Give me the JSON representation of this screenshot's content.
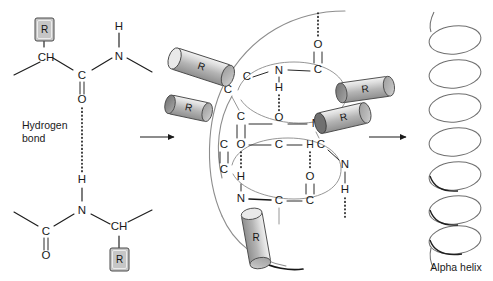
{
  "figure": {
    "background": "#ffffff",
    "accent_grey": "#c6c6c6",
    "line_color": "#1d1d1d"
  },
  "panel_left": {
    "name": "hydrogen-bond-detail",
    "hydrogen_bond_label": "Hydrogen\nbond",
    "hydrogen_bond_label_line1": "Hydrogen",
    "hydrogen_bond_label_line2": "bond",
    "top_chain": {
      "r_group": "R",
      "alpha_carbon": "CH",
      "carbonyl_carbon": "C",
      "carbonyl_oxygen": "O",
      "amide_nitrogen": "N",
      "amide_hydrogen": "H"
    },
    "bottom_chain": {
      "r_group": "R",
      "alpha_carbon": "CH",
      "carbonyl_carbon": "C",
      "carbonyl_oxygen": "O",
      "amide_nitrogen": "N",
      "amide_hydrogen": "H"
    }
  },
  "panel_center": {
    "name": "helix-turn-detail",
    "atoms": {
      "a1": "C",
      "a2": "N",
      "a3": "C",
      "a4": "O",
      "a5": "C",
      "a6": "C",
      "a7": "H",
      "a8": "O",
      "a9": "C",
      "a10": "N",
      "a11": "C",
      "a12": "O",
      "a13": "C",
      "a14": "H",
      "a15": "C",
      "a16": "O",
      "a17": "N",
      "a18": "H",
      "a19": "H",
      "a20": "C",
      "a21": "O",
      "a22": "N",
      "a23": "C",
      "a24": "C",
      "a25": "O",
      "a26": "C",
      "a27": "H"
    },
    "r_groups": [
      "R",
      "R",
      "R",
      "R",
      "R"
    ]
  },
  "panel_right": {
    "name": "alpha-helix-coil",
    "caption": "Alpha helix",
    "turns": 7
  },
  "arrows": {
    "arrow1_name": "transition-arrow-1",
    "arrow2_name": "transition-arrow-2"
  }
}
